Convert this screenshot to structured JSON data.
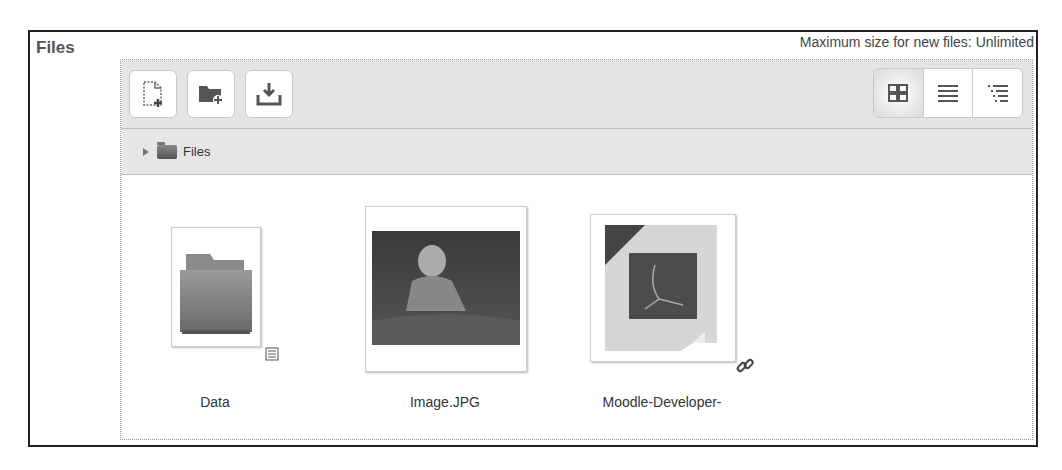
{
  "section": {
    "label": "Files"
  },
  "max_size_text": "Maximum size for new files: Unlimited",
  "toolbar": {
    "buttons": [
      {
        "name": "add-file",
        "icon": "file-add-icon"
      },
      {
        "name": "create-folder",
        "icon": "folder-add-icon"
      },
      {
        "name": "download",
        "icon": "download-icon"
      }
    ],
    "views": [
      {
        "name": "icons-view",
        "icon": "grid-icon",
        "active": true
      },
      {
        "name": "details-view",
        "icon": "list-icon",
        "active": false
      },
      {
        "name": "tree-view",
        "icon": "tree-list-icon",
        "active": false
      }
    ]
  },
  "path": {
    "label": "Files"
  },
  "files": [
    {
      "name": "Data",
      "type": "folder",
      "badge": "context-menu-icon"
    },
    {
      "name": "Image.JPG",
      "type": "image"
    },
    {
      "name": "Moodle-Developer-",
      "type": "pdf",
      "badge": "link-icon"
    }
  ],
  "colors": {
    "toolbar_bg": "#e4e4e4",
    "border": "#222222",
    "pdf_red": "#4a4a4a"
  }
}
